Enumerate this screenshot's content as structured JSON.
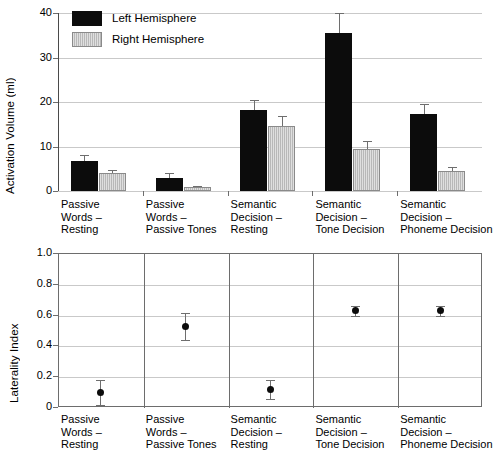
{
  "chart_data": [
    {
      "type": "bar",
      "title": "",
      "xlabel": "",
      "ylabel": "Activation Volume (ml)",
      "ylim": [
        0,
        40
      ],
      "yticks": [
        "0",
        "10",
        "20",
        "30",
        "40"
      ],
      "ytick_values": [
        0,
        10,
        20,
        30,
        40
      ],
      "grid": true,
      "legend_position": "top-left",
      "legend": [
        "Left Hemisphere",
        "Right Hemisphere"
      ],
      "categories": [
        "Passive\nWords –\nResting",
        "Passive\nWords –\nPassive Tones",
        "Semantic\nDecision –\nResting",
        "Semantic\nDecision –\nTone Decision",
        "Semantic\nDecision –\nPhoneme Decision"
      ],
      "series": [
        {
          "name": "Left Hemisphere",
          "color": "#0c0c0c",
          "values": [
            6.7,
            3.0,
            18.2,
            35.5,
            17.2
          ],
          "errors": [
            1.4,
            1.1,
            2.2,
            4.5,
            2.3
          ]
        },
        {
          "name": "Right Hemisphere",
          "color": "#b8b8b8",
          "values": [
            4.0,
            0.8,
            14.6,
            9.5,
            4.4
          ],
          "errors": [
            0.7,
            0.4,
            2.3,
            1.7,
            1.1
          ]
        }
      ]
    },
    {
      "type": "scatter",
      "title": "",
      "xlabel": "",
      "ylabel": "Laterality Index",
      "ylim": [
        0,
        1.0
      ],
      "yticks": [
        "0",
        "0.2",
        "0.4",
        "0.6",
        "0.8",
        "1.0"
      ],
      "ytick_values": [
        0,
        0.2,
        0.4,
        0.6,
        0.8,
        1.0
      ],
      "grid": true,
      "categories": [
        "Passive\nWords –\nResting",
        "Passive\nWords –\nPassive Tones",
        "Semantic\nDecision –\nResting",
        "Semantic\nDecision –\nTone Decision",
        "Semantic\nDecision –\nPhoneme Decision"
      ],
      "values": [
        0.1,
        0.53,
        0.12,
        0.63,
        0.63
      ],
      "errors": [
        0.08,
        0.09,
        0.06,
        0.03,
        0.03
      ]
    }
  ]
}
